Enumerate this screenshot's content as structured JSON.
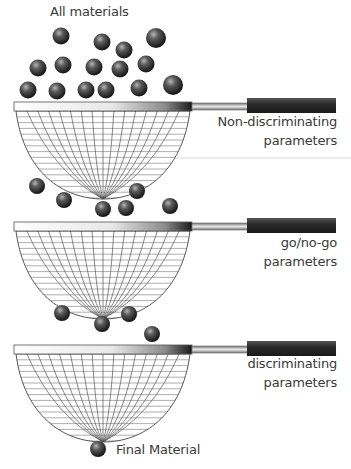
{
  "title": "All materials",
  "stages": [
    {
      "label_line1": "Non-discriminating",
      "label_line2": "parameters",
      "rim_y": 102
    },
    {
      "label_line1": "go/no-go",
      "label_line2": "parameters",
      "rim_y": 222
    },
    {
      "label_line1": "discriminating",
      "label_line2": "parameters",
      "rim_y": 345
    }
  ],
  "final_label": "Final Material",
  "balls": {
    "top": [
      [
        61,
        36
      ],
      [
        102,
        42
      ],
      [
        124,
        50
      ],
      [
        156,
        38
      ],
      [
        38,
        68
      ],
      [
        63,
        65
      ],
      [
        94,
        67
      ],
      [
        120,
        69
      ],
      [
        146,
        64
      ],
      [
        28,
        90
      ],
      [
        57,
        91
      ],
      [
        86,
        90
      ],
      [
        106,
        90
      ],
      [
        139,
        88
      ],
      [
        173,
        85
      ]
    ],
    "stage1_out": [
      [
        37,
        186
      ],
      [
        64,
        200
      ],
      [
        103,
        209
      ],
      [
        126,
        208
      ],
      [
        137,
        191
      ],
      [
        170,
        206
      ]
    ],
    "stage2_out": [
      [
        62,
        313
      ],
      [
        102,
        324
      ],
      [
        129,
        314
      ],
      [
        152,
        334
      ]
    ],
    "final": [
      [
        98,
        449
      ]
    ]
  },
  "colors": {
    "ball_dark": "#1e1e1e",
    "ball_light": "#9a9a9a",
    "grip": "#2a2a2a",
    "mesh": "#555555",
    "text": "#3a3a3a"
  }
}
